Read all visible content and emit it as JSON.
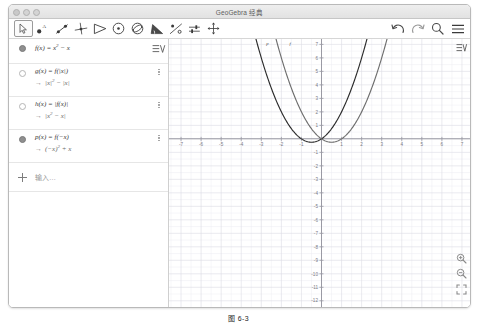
{
  "window": {
    "title": "GeoGebra 经典",
    "traffic_lights": [
      "close",
      "minimize",
      "zoom"
    ]
  },
  "toolbar": {
    "left_tools": [
      {
        "name": "move-tool",
        "label": "移动",
        "selected": true
      },
      {
        "name": "point-tool",
        "label": "点",
        "selected": false
      },
      {
        "name": "line-tool",
        "label": "直线",
        "selected": false
      },
      {
        "name": "perpendicular-line-tool",
        "label": "垂线",
        "selected": false
      },
      {
        "name": "polygon-tool",
        "label": "多边形",
        "selected": false
      },
      {
        "name": "circle-tool",
        "label": "圆",
        "selected": false
      },
      {
        "name": "ellipse-tool",
        "label": "圆锥曲线",
        "selected": false
      },
      {
        "name": "angle-tool",
        "label": "角度",
        "selected": false
      },
      {
        "name": "reflect-tool",
        "label": "变换",
        "selected": false
      },
      {
        "name": "slider-tool",
        "label": "滑动条",
        "selected": false
      },
      {
        "name": "move-graphics-tool",
        "label": "移动绘图区",
        "selected": false
      }
    ],
    "right_tools": [
      {
        "name": "undo-button",
        "label": "撤销"
      },
      {
        "name": "redo-button",
        "label": "重做"
      },
      {
        "name": "search-button",
        "label": "搜索"
      },
      {
        "name": "menu-button",
        "label": "菜单"
      }
    ]
  },
  "algebra": {
    "list_icon_label": "运算区设置",
    "rows": [
      {
        "index": 1,
        "marker": "filled",
        "definition": "f(x) = x² − x",
        "def_parts": {
          "pre": "f(x) = x",
          "sup": "2",
          "post": " − x"
        },
        "output": null,
        "has_kebab": false,
        "has_list_icon": true
      },
      {
        "index": 2,
        "marker": "hollow",
        "definition": "g(x) = f(|x|)",
        "def_parts": {
          "pre": "g(x) = f(|x|)",
          "sup": "",
          "post": ""
        },
        "output": "→ |x|² − |x|",
        "out_parts": {
          "pre": "|x|",
          "sup": "2",
          "post": " − |x|"
        },
        "has_kebab": true,
        "has_list_icon": false
      },
      {
        "index": 3,
        "marker": "hollow",
        "definition": "h(x) = |f(x)|",
        "def_parts": {
          "pre": "h(x) = |f(x)|",
          "sup": "",
          "post": ""
        },
        "output": "→ |x² − x|",
        "out_parts": {
          "pre": "|x",
          "sup": "2",
          "post": " − x|"
        },
        "has_kebab": true,
        "has_list_icon": false
      },
      {
        "index": 4,
        "marker": "filled",
        "definition": "p(x) = f(−x)",
        "def_parts": {
          "pre": "p(x) = f(−x)",
          "sup": "",
          "post": ""
        },
        "output": "→ (−x)² + x",
        "out_parts": {
          "pre": "(−x)",
          "sup": "2",
          "post": " + x"
        },
        "has_kebab": true,
        "has_list_icon": false
      }
    ],
    "input_row": {
      "placeholder": "输入…",
      "add_label": "+"
    }
  },
  "graphics": {
    "gear_label": "绘图区设置",
    "zoom_in_label": "放大",
    "zoom_out_label": "缩小",
    "zoom_fit_label": "标准视图",
    "curve_labels": [
      {
        "text": "p",
        "x": 262,
        "y": 44
      },
      {
        "text": "f",
        "x": 285,
        "y": 44
      }
    ]
  },
  "caption": {
    "text": "图 6-3"
  },
  "colors": {
    "curve_dark": "#2b2b2b",
    "curve_gray": "#6e6e6e",
    "grid_minor": "#ededf2",
    "grid_major": "#dcdce4",
    "axis": "#9a9aa4",
    "panel_border": "#cfcfcf",
    "tick_text": "#7a7a84"
  },
  "chart_data": {
    "type": "line",
    "title": "",
    "xlabel": "x",
    "ylabel": "y",
    "xlim": [
      -7.6,
      7.4
    ],
    "ylim": [
      -12.6,
      7.4
    ],
    "xticks": [
      -7,
      -6,
      -5,
      -4,
      -3,
      -2,
      -1,
      1,
      2,
      3,
      4,
      5,
      6,
      7
    ],
    "yticks": [
      7,
      6,
      5,
      4,
      3,
      2,
      1,
      -1,
      -2,
      -3,
      -4,
      -5,
      -6,
      -7,
      -8,
      -9,
      -10,
      -11,
      -12
    ],
    "grid": true,
    "legend": false,
    "series": [
      {
        "name": "f",
        "label": "f(x) = x² − x",
        "color": "#6e6e6e",
        "vertex": [
          0.5,
          -0.25
        ],
        "roots": [
          0,
          1
        ]
      },
      {
        "name": "p",
        "label": "p(x) = f(−x) = x² + x",
        "color": "#2b2b2b",
        "vertex": [
          -0.5,
          -0.25
        ],
        "roots": [
          -1,
          0
        ]
      }
    ]
  }
}
